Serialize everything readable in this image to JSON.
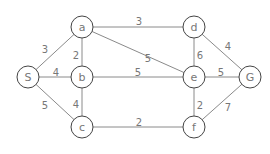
{
  "graph": {
    "nodes": [
      {
        "id": "S",
        "label": "S"
      },
      {
        "id": "a",
        "label": "a"
      },
      {
        "id": "b",
        "label": "b"
      },
      {
        "id": "c",
        "label": "c"
      },
      {
        "id": "d",
        "label": "d"
      },
      {
        "id": "e",
        "label": "e"
      },
      {
        "id": "f",
        "label": "f"
      },
      {
        "id": "G",
        "label": "G"
      }
    ],
    "edges": [
      {
        "from": "S",
        "to": "a",
        "weight": "3"
      },
      {
        "from": "S",
        "to": "b",
        "weight": "4"
      },
      {
        "from": "S",
        "to": "c",
        "weight": "5"
      },
      {
        "from": "a",
        "to": "d",
        "weight": "3"
      },
      {
        "from": "a",
        "to": "b",
        "weight": "2"
      },
      {
        "from": "a",
        "to": "e",
        "weight": "5"
      },
      {
        "from": "b",
        "to": "e",
        "weight": "5"
      },
      {
        "from": "b",
        "to": "c",
        "weight": "4"
      },
      {
        "from": "c",
        "to": "f",
        "weight": "2"
      },
      {
        "from": "d",
        "to": "e",
        "weight": "6"
      },
      {
        "from": "d",
        "to": "G",
        "weight": "4"
      },
      {
        "from": "e",
        "to": "G",
        "weight": "5"
      },
      {
        "from": "e",
        "to": "f",
        "weight": "2"
      },
      {
        "from": "f",
        "to": "G",
        "weight": "7"
      }
    ]
  }
}
